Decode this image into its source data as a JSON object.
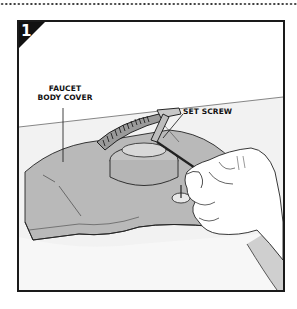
{
  "step": {
    "number": "1"
  },
  "callouts": {
    "faucet_body_cover_line1": "FAUCET",
    "faucet_body_cover_line2": "BODY COVER",
    "set_screw": "SET SCREW"
  },
  "colors": {
    "frame": "#1a1a1a",
    "body_fill": "#b9b9b9",
    "counter_fill": "#e6e6e6",
    "hand_fill": "#ffffff"
  }
}
